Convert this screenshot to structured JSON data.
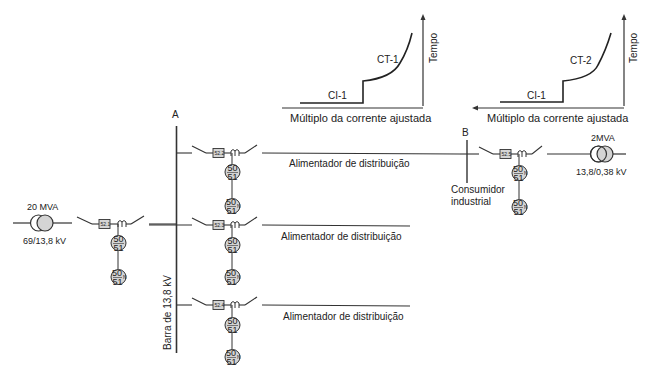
{
  "curves": [
    {
      "id": "curve-1",
      "instant_label": "CI-1",
      "time_label": "CT-1",
      "x_axis_label": "Múltiplo da corrente ajustada",
      "y_axis_label": "Tempo"
    },
    {
      "id": "curve-2",
      "instant_label": "CI-1",
      "time_label": "CT-2",
      "x_axis_label": "Múltiplo da corrente ajustada",
      "y_axis_label": "Tempo"
    }
  ],
  "source_transformer": {
    "rating": "20 MVA",
    "voltage": "69/13,8 kV"
  },
  "bus": {
    "node_label": "A",
    "name": "Barra de 13,8 kV"
  },
  "incoming": {
    "breaker": "52.1",
    "relay_phase_top": "50",
    "relay_phase_bottom": "51",
    "relay_neutral_top": "50",
    "relay_neutral_mid": "N",
    "relay_neutral_bottom": "51"
  },
  "feeders": [
    {
      "breaker": "52.2",
      "label": "Alimentador de distribuição",
      "relay_top": "50",
      "relay_bottom": "51",
      "relayn_top": "50",
      "relayn_mid": "N",
      "relayn_bottom": "51"
    },
    {
      "breaker": "52.3",
      "label": "Alimentador de distribuição",
      "relay_top": "50",
      "relay_bottom": "51",
      "relayn_top": "50",
      "relayn_mid": "N",
      "relayn_bottom": "51"
    },
    {
      "breaker": "52.4",
      "label": "Alimentador de distribuição",
      "relay_top": "50",
      "relay_bottom": "51",
      "relayn_top": "50",
      "relayn_mid": "N",
      "relayn_bottom": "51"
    }
  ],
  "consumer": {
    "node_label": "B",
    "name_line1": "Consumidor",
    "name_line2": "industrial",
    "breaker": "52.5",
    "relay1_top": "50",
    "relay1_mid": "N",
    "relay1_bottom": "51",
    "relay2_top": "50",
    "relay2_mid": "N",
    "relay2_bottom": "51",
    "transformer_rating": "2MVA",
    "transformer_voltage": "13,8/0,38 kV"
  },
  "colors": {
    "line": "#333333",
    "fill_gray": "#d4d4d4",
    "text": "#222222"
  }
}
